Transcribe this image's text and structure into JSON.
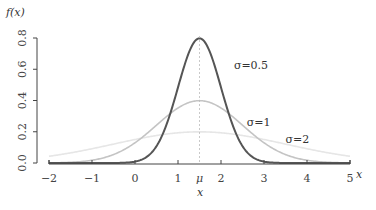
{
  "chart_data": {
    "type": "line",
    "title": "",
    "xlabel": "x",
    "ylabel": "f(x)",
    "xlim": [
      -2,
      5
    ],
    "ylim": [
      0,
      0.8
    ],
    "mu": 1.5,
    "x_ticks": [
      {
        "value": -2,
        "label": "−2"
      },
      {
        "value": -1,
        "label": "−1"
      },
      {
        "value": 0,
        "label": "0"
      },
      {
        "value": 1,
        "label": "1"
      },
      {
        "value": 1.5,
        "label": "μ"
      },
      {
        "value": 2,
        "label": "2"
      },
      {
        "value": 3,
        "label": "3"
      },
      {
        "value": 4,
        "label": "4"
      },
      {
        "value": 5,
        "label": "5"
      }
    ],
    "y_ticks": [
      {
        "value": 0.0,
        "label": "0.0"
      },
      {
        "value": 0.2,
        "label": "0.2"
      },
      {
        "value": 0.4,
        "label": "0.4"
      },
      {
        "value": 0.6,
        "label": "0.6"
      },
      {
        "value": 0.8,
        "label": "0.8"
      }
    ],
    "x_axis_end_label": "x",
    "series": [
      {
        "name": "σ=0.5",
        "sigma": 0.5,
        "mu": 1.5,
        "color": "#555555",
        "label": "σ=0.5",
        "label_x": 2.3,
        "label_y": 0.6
      },
      {
        "name": "σ=1",
        "sigma": 1,
        "mu": 1.5,
        "color": "#c4c4c4",
        "label": "σ=1",
        "label_x": 2.6,
        "label_y": 0.24
      },
      {
        "name": "σ=2",
        "sigma": 2,
        "mu": 1.5,
        "color": "#e6e6e6",
        "label": "σ=2",
        "label_x": 3.5,
        "label_y": 0.13
      }
    ],
    "grid": false,
    "legend": "none (inline labels)",
    "mean_line": {
      "x": 1.5,
      "style": "dotted",
      "color": "#bbbbbb"
    }
  }
}
